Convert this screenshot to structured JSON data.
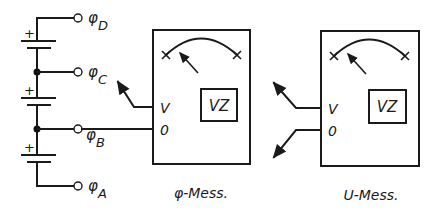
{
  "diagram": {
    "battery_stack": {
      "cells": [
        {
          "polarity_label": "+"
        },
        {
          "polarity_label": "+"
        },
        {
          "polarity_label": "+"
        }
      ],
      "terminals": [
        {
          "symbol": "φ",
          "subscript": "D"
        },
        {
          "symbol": "φ",
          "subscript": "C"
        },
        {
          "symbol": "φ",
          "subscript": "B"
        },
        {
          "symbol": "φ",
          "subscript": "A"
        }
      ]
    },
    "meters": [
      {
        "caption": "φ-Mess.",
        "display_label": "VZ",
        "input_labels": [
          "V",
          "0"
        ]
      },
      {
        "caption": "U-Mess.",
        "display_label": "VZ",
        "input_labels": [
          "V",
          "0"
        ]
      }
    ]
  }
}
